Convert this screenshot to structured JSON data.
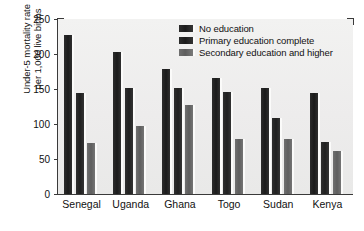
{
  "chart_data": {
    "type": "bar",
    "title": "",
    "xlabel": "",
    "ylabel": "Under-5 mortality rate\nper 1,000 live births",
    "ylim": [
      0,
      250
    ],
    "yticks": [
      0,
      50,
      100,
      150,
      200,
      250
    ],
    "grid": false,
    "legend_position": "top-right",
    "categories": [
      "Senegal",
      "Uganda",
      "Ghana",
      "Togo",
      "Sudan",
      "Kenya"
    ],
    "series": [
      {
        "name": "No education",
        "color": "#1f1f1f",
        "values": [
          227,
          203,
          179,
          166,
          151,
          144
        ]
      },
      {
        "name": "Primary education complete",
        "color": "#242424",
        "values": [
          144,
          151,
          151,
          146,
          109,
          74
        ]
      },
      {
        "name": "Secondary education and higher",
        "color": "#666666",
        "values": [
          73,
          97,
          127,
          79,
          78,
          62
        ]
      }
    ]
  },
  "axis": {
    "y_title_line1": "Under-5 mortality rate",
    "y_title_line2": "per 1,000 live births"
  }
}
